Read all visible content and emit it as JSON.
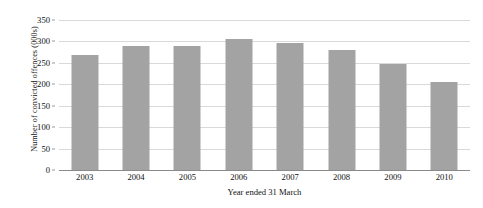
{
  "chart_data": {
    "type": "bar",
    "title": "",
    "xlabel": "Year ended 31 March",
    "ylabel": "Number of convicted offences (000s)",
    "categories": [
      "2003",
      "2004",
      "2005",
      "2006",
      "2007",
      "2008",
      "2009",
      "2010"
    ],
    "values": [
      268,
      289,
      289,
      305,
      297,
      281,
      247,
      205
    ],
    "series": [
      {
        "name": "Number of convicted offences (000s)",
        "values": [
          268,
          289,
          289,
          305,
          297,
          281,
          247,
          205
        ]
      }
    ],
    "ylim": [
      0,
      350
    ],
    "yticks": [
      0,
      50,
      100,
      150,
      200,
      250,
      300,
      350
    ],
    "ytick_labels": [
      "0",
      "50",
      "100",
      "150",
      "200",
      "250",
      "300",
      "350"
    ],
    "grid": true,
    "legend": false,
    "legend_position": "none",
    "bar_color": "#a3a3a3",
    "gridline_color": "#d9d9d9",
    "axis_color": "#8a8a8a",
    "background_color": "#ffffff"
  }
}
